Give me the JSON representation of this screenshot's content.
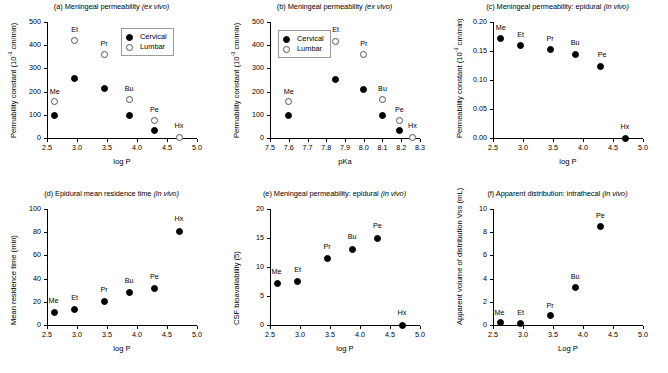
{
  "figure": {
    "legend_labels": {
      "cervical": "Cervical",
      "lumbar": "Lumbar"
    },
    "colors": {
      "cervical": "#000000",
      "lumbar": "#ffffff",
      "axis": "#000000"
    }
  },
  "chart_data": [
    {
      "id": "a",
      "type": "scatter",
      "title": "(a) Meningeal permeability (ex vivo)",
      "title_plain": "(a) Meningeal permeability ",
      "title_italic": "(ex vivo)",
      "xlabel": "log P",
      "ylabel": "Permability constant (10-3 cm/min)",
      "ylabel_pre": "Permability constant (10",
      "ylabel_sup": "-3",
      "ylabel_post": " cm/min)",
      "xlim": [
        2.5,
        5.0
      ],
      "ylim": [
        0,
        500
      ],
      "xticks": [
        2.5,
        3.0,
        3.5,
        4.0,
        4.5,
        5.0
      ],
      "xticklabels": [
        "2.5",
        "3.0",
        "3.5",
        "4.0",
        "4.5",
        "5.0"
      ],
      "yticks": [
        0,
        100,
        200,
        300,
        400,
        500
      ],
      "yticklabels": [
        "0",
        "100",
        "200",
        "300",
        "400",
        "500"
      ],
      "grid": false,
      "legend_position": "upper-right-inside",
      "series": [
        {
          "name": "Cervical",
          "marker": "filled",
          "points": [
            {
              "label": "Me",
              "x": 2.63,
              "y": 96
            },
            {
              "label": "Et",
              "x": 2.96,
              "y": 255
            },
            {
              "label": "Pr",
              "x": 3.45,
              "y": 212
            },
            {
              "label": "Bu",
              "x": 3.87,
              "y": 96
            },
            {
              "label": "Pe",
              "x": 4.29,
              "y": 34
            }
          ]
        },
        {
          "name": "Lumbar",
          "marker": "open",
          "points": [
            {
              "label": "Me",
              "x": 2.63,
              "y": 158
            },
            {
              "label": "Et",
              "x": 2.96,
              "y": 419
            },
            {
              "label": "Pr",
              "x": 3.45,
              "y": 358
            },
            {
              "label": "Bu",
              "x": 3.87,
              "y": 167
            },
            {
              "label": "Pe",
              "x": 4.29,
              "y": 77
            },
            {
              "label": "Hx",
              "x": 4.7,
              "y": 2
            }
          ]
        }
      ],
      "annotations": [
        {
          "text": "Me",
          "x": 2.63,
          "y": 200
        },
        {
          "text": "Et",
          "x": 2.96,
          "y": 466
        },
        {
          "text": "Pr",
          "x": 3.45,
          "y": 404
        },
        {
          "text": "Bu",
          "x": 3.87,
          "y": 213
        },
        {
          "text": "Pe",
          "x": 4.29,
          "y": 122
        },
        {
          "text": "Hx",
          "x": 4.7,
          "y": 50
        }
      ]
    },
    {
      "id": "b",
      "type": "scatter",
      "title": "(b) Meningeal permeability (ex vivo)",
      "title_plain": "(b) Meningeal permeability ",
      "title_italic": "(ex vivo)",
      "xlabel": "pKa",
      "ylabel": "Permability constant (10-3 cm/min)",
      "ylabel_pre": "Permability constant (10",
      "ylabel_sup": "-3",
      "ylabel_post": " cm/min)",
      "xlim": [
        7.5,
        8.3
      ],
      "ylim": [
        0,
        500
      ],
      "xticks": [
        7.5,
        7.6,
        7.7,
        7.8,
        7.9,
        8.0,
        8.1,
        8.2,
        8.3
      ],
      "xticklabels": [
        "7.5",
        "7.6",
        "7.7",
        "7.8",
        "7.9",
        "8.0",
        "8.1",
        "8.2",
        "8.3"
      ],
      "yticks": [
        0,
        100,
        200,
        300,
        400,
        500
      ],
      "yticklabels": [
        "0",
        "100",
        "200",
        "300",
        "400",
        "500"
      ],
      "grid": false,
      "legend_position": "upper-left-inside",
      "series": [
        {
          "name": "Cervical",
          "marker": "filled",
          "points": [
            {
              "label": "Me",
              "x": 7.6,
              "y": 96
            },
            {
              "label": "Et",
              "x": 7.85,
              "y": 254
            },
            {
              "label": "Pr",
              "x": 8.0,
              "y": 209
            },
            {
              "label": "Bu",
              "x": 8.1,
              "y": 95
            },
            {
              "label": "Pe",
              "x": 8.19,
              "y": 34
            }
          ]
        },
        {
          "name": "Lumbar",
          "marker": "open",
          "points": [
            {
              "label": "Me",
              "x": 7.6,
              "y": 158
            },
            {
              "label": "Et",
              "x": 7.85,
              "y": 418
            },
            {
              "label": "Pr",
              "x": 8.0,
              "y": 358
            },
            {
              "label": "Bu",
              "x": 8.1,
              "y": 165
            },
            {
              "label": "Pe",
              "x": 8.19,
              "y": 77
            },
            {
              "label": "Hx",
              "x": 8.26,
              "y": 2
            }
          ]
        }
      ],
      "annotations": [
        {
          "text": "Me",
          "x": 7.6,
          "y": 200
        },
        {
          "text": "Et",
          "x": 7.85,
          "y": 464
        },
        {
          "text": "Pr",
          "x": 8.0,
          "y": 404
        },
        {
          "text": "Bu",
          "x": 8.1,
          "y": 211
        },
        {
          "text": "Pe",
          "x": 8.19,
          "y": 122
        },
        {
          "text": "Hx",
          "x": 8.26,
          "y": 50
        }
      ]
    },
    {
      "id": "c",
      "type": "scatter",
      "title": "(c) Meningeal permeability: epidural (in vivo)",
      "title_plain": "(c) Meningeal permeability: epidural ",
      "title_italic": "(in vivo)",
      "xlabel": "log P",
      "ylabel": "Permeability constant (10-3 cm/min)",
      "ylabel_pre": "Permeability constant (10",
      "ylabel_sup": "-3",
      "ylabel_post": " cm/min)",
      "xlim": [
        2.5,
        5.0
      ],
      "ylim": [
        0,
        0.2
      ],
      "xticks": [
        2.5,
        3.0,
        3.5,
        4.0,
        4.5,
        5.0
      ],
      "xticklabels": [
        "2.5",
        "3.0",
        "3.5",
        "4.0",
        "4.5",
        "5.0"
      ],
      "yticks": [
        0,
        0.05,
        0.1,
        0.15,
        0.2
      ],
      "yticklabels": [
        "0.00",
        "0.05",
        "0.10",
        "0.15",
        "0.20"
      ],
      "grid": false,
      "legend_position": "none",
      "series": [
        {
          "name": "Epidural",
          "marker": "filled",
          "points": [
            {
              "label": "Me",
              "x": 2.63,
              "y": 0.171
            },
            {
              "label": "Et",
              "x": 2.96,
              "y": 0.159
            },
            {
              "label": "Pr",
              "x": 3.45,
              "y": 0.152
            },
            {
              "label": "Bu",
              "x": 3.87,
              "y": 0.144
            },
            {
              "label": "Pe",
              "x": 4.29,
              "y": 0.124
            },
            {
              "label": "Hx",
              "x": 4.7,
              "y": 0.0
            }
          ]
        }
      ],
      "annotations": [
        {
          "text": "Me",
          "x": 2.63,
          "y": 0.19
        },
        {
          "text": "Et",
          "x": 2.96,
          "y": 0.178
        },
        {
          "text": "Pr",
          "x": 3.45,
          "y": 0.171
        },
        {
          "text": "Bu",
          "x": 3.87,
          "y": 0.163
        },
        {
          "text": "Pe",
          "x": 4.32,
          "y": 0.143
        },
        {
          "text": "Hx",
          "x": 4.7,
          "y": 0.019
        }
      ]
    },
    {
      "id": "d",
      "type": "scatter",
      "title": "(d) Epidural mean residence time (in vivo)",
      "title_plain": "(d) Epidural mean residence time ",
      "title_italic": "(in vivo)",
      "xlabel": "log P",
      "ylabel": "Mean residence time (min)",
      "ylabel_pre": "Mean residence time (min)",
      "ylabel_sup": "",
      "ylabel_post": "",
      "xlim": [
        2.5,
        5.0
      ],
      "ylim": [
        0,
        100
      ],
      "xticks": [
        2.5,
        3.0,
        3.5,
        4.0,
        4.5,
        5.0
      ],
      "xticklabels": [
        "2.5",
        "3.0",
        "3.5",
        "4.0",
        "4.5",
        "5.0"
      ],
      "yticks": [
        0,
        20,
        40,
        60,
        80,
        100
      ],
      "yticklabels": [
        "0",
        "20",
        "40",
        "60",
        "80",
        "100"
      ],
      "grid": false,
      "legend_position": "none",
      "series": [
        {
          "name": "Epidural MRT",
          "marker": "filled",
          "points": [
            {
              "label": "Me",
              "x": 2.63,
              "y": 11
            },
            {
              "label": "Et",
              "x": 2.96,
              "y": 13.5
            },
            {
              "label": "Pr",
              "x": 3.45,
              "y": 20
            },
            {
              "label": "Bu",
              "x": 3.87,
              "y": 28
            },
            {
              "label": "Pe",
              "x": 4.29,
              "y": 31.5
            },
            {
              "label": "Hx",
              "x": 4.7,
              "y": 81
            }
          ]
        }
      ],
      "annotations": [
        {
          "text": "Me",
          "x": 2.61,
          "y": 21
        },
        {
          "text": "Et",
          "x": 2.96,
          "y": 23.5
        },
        {
          "text": "Pr",
          "x": 3.45,
          "y": 30
        },
        {
          "text": "Bu",
          "x": 3.87,
          "y": 38
        },
        {
          "text": "Pe",
          "x": 4.29,
          "y": 41.5
        },
        {
          "text": "Hx",
          "x": 4.7,
          "y": 91
        }
      ]
    },
    {
      "id": "e",
      "type": "scatter",
      "title": "(e) Meningeal permeability: epidural (in vivo)",
      "title_plain": "(e) Meningeal permeability: epidural ",
      "title_italic": "(in vivo)",
      "xlabel": "log P",
      "ylabel": "CSF bioavailability (5)",
      "ylabel_pre": "CSF bioavailability (5)",
      "ylabel_sup": "",
      "ylabel_post": "",
      "xlim": [
        2.5,
        5.0
      ],
      "ylim": [
        0,
        20
      ],
      "xticks": [
        2.5,
        3.0,
        3.5,
        4.0,
        4.5,
        5.0
      ],
      "xticklabels": [
        "2.5",
        "3.0",
        "3.5",
        "4.0",
        "4.5",
        "5.0"
      ],
      "yticks": [
        0,
        5,
        10,
        15,
        20
      ],
      "yticklabels": [
        "0",
        "5",
        "10",
        "15",
        "20"
      ],
      "grid": false,
      "legend_position": "none",
      "series": [
        {
          "name": "CSF bioavailability",
          "marker": "filled",
          "points": [
            {
              "label": "Me",
              "x": 2.63,
              "y": 7.2
            },
            {
              "label": "Et",
              "x": 2.96,
              "y": 7.5
            },
            {
              "label": "Pr",
              "x": 3.45,
              "y": 11.5
            },
            {
              "label": "Bu",
              "x": 3.87,
              "y": 13.0
            },
            {
              "label": "Pe",
              "x": 4.29,
              "y": 14.9
            },
            {
              "label": "Hx",
              "x": 4.7,
              "y": 0.0
            }
          ]
        }
      ],
      "annotations": [
        {
          "text": "Me",
          "x": 2.61,
          "y": 9.2
        },
        {
          "text": "Et",
          "x": 2.96,
          "y": 9.5
        },
        {
          "text": "Pr",
          "x": 3.45,
          "y": 13.5
        },
        {
          "text": "Bu",
          "x": 3.87,
          "y": 15.2
        },
        {
          "text": "Pe",
          "x": 4.29,
          "y": 17.0
        },
        {
          "text": "Hx",
          "x": 4.7,
          "y": 2.1
        }
      ]
    },
    {
      "id": "f",
      "type": "scatter",
      "title": "(f) Apparent distribution: intrathecal (in vivo)",
      "title_plain": "(f) Apparent distribution: intrathecal ",
      "title_italic": "(in vivo)",
      "xlabel": "Log P",
      "ylabel": "Apparent volume of distribution Vss (mL)",
      "ylabel_pre": "Apparent volume of distribution Vss (mL)",
      "ylabel_sup": "",
      "ylabel_post": "",
      "xlim": [
        2.5,
        5.0
      ],
      "ylim": [
        0,
        10
      ],
      "xticks": [
        2.5,
        3.0,
        3.5,
        4.0,
        4.5,
        5.0
      ],
      "xticklabels": [
        "2.5",
        "3.0",
        "3.5",
        "4.0",
        "4.5",
        "5.0"
      ],
      "yticks": [
        0,
        2,
        4,
        6,
        8,
        10
      ],
      "yticklabels": [
        "0",
        "2",
        "4",
        "6",
        "8",
        "10"
      ],
      "grid": false,
      "legend_position": "none",
      "series": [
        {
          "name": "Vss",
          "marker": "filled",
          "points": [
            {
              "label": "Me",
              "x": 2.63,
              "y": 0.18
            },
            {
              "label": "Et",
              "x": 2.96,
              "y": 0.15
            },
            {
              "label": "Pr",
              "x": 3.45,
              "y": 0.78
            },
            {
              "label": "Bu",
              "x": 3.87,
              "y": 3.2
            },
            {
              "label": "Pe",
              "x": 4.29,
              "y": 8.5
            }
          ]
        }
      ],
      "annotations": [
        {
          "text": "Me",
          "x": 2.61,
          "y": 1.05
        },
        {
          "text": "Et",
          "x": 2.96,
          "y": 1.02
        },
        {
          "text": "Pr",
          "x": 3.45,
          "y": 1.65
        },
        {
          "text": "Bu",
          "x": 3.87,
          "y": 4.1
        },
        {
          "text": "Pe",
          "x": 4.29,
          "y": 9.4
        }
      ]
    }
  ]
}
